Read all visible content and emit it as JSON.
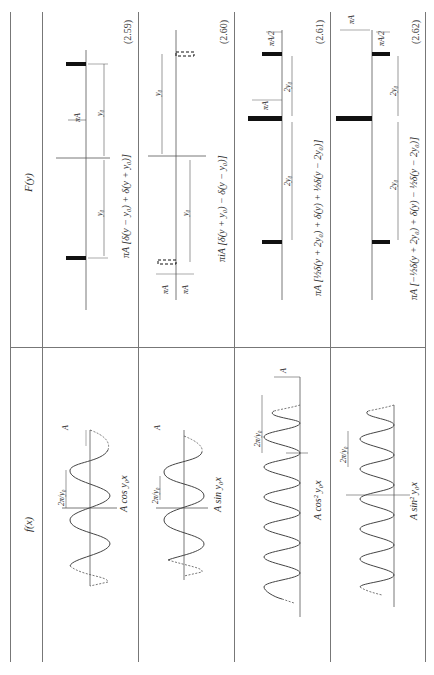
{
  "page": {
    "orientation": "rotated-90-ccw",
    "columns": {
      "function_header": "f(x)",
      "transform_header": "F(y)"
    }
  },
  "rows": [
    {
      "equation_number": "(2.59)",
      "f_label": "A cos y₀x",
      "F_formula": "πA [δ(y − y₀) + δ(y + y₀)]",
      "f_annotations": {
        "amplitude": "A",
        "period": "2π/y₀"
      },
      "F_annotations": {
        "height": "πA",
        "offset_pos": "y₀",
        "offset_neg": "y₀"
      }
    },
    {
      "equation_number": "(2.60)",
      "f_label": "A sin y₀x",
      "F_formula": "πiA [δ(y + y₀) − δ(y − y₀)]",
      "f_annotations": {
        "amplitude": "A",
        "period": "2π/y₀"
      },
      "F_annotations": {
        "height_pos": "πA",
        "height_neg": "πA",
        "offset_pos": "y₀",
        "offset_neg": "y₀"
      }
    },
    {
      "equation_number": "(2.61)",
      "f_label": "A cos² y₀x",
      "F_formula": "πA [½δ(y + 2y₀) + δ(y) + ½δ(y − 2y₀)]",
      "f_annotations": {
        "amplitude": "A",
        "period": "2π/y₀"
      },
      "F_annotations": {
        "height_center": "πA",
        "height_side": "πA/2",
        "offset_pos": "2y₀",
        "offset_neg": "2y₀"
      }
    },
    {
      "equation_number": "(2.62)",
      "f_label": "A sin² y₀x",
      "F_formula": "πA [−½δ(y + 2y₀) + δ(y) − ½δ(y − 2y₀)]",
      "f_annotations": {
        "amplitude": "A",
        "period": "2π/y₀"
      },
      "F_annotations": {
        "height_center": "πA",
        "height_side": "πA/2",
        "offset_pos": "2y₀",
        "offset_neg": "2y₀"
      }
    }
  ]
}
